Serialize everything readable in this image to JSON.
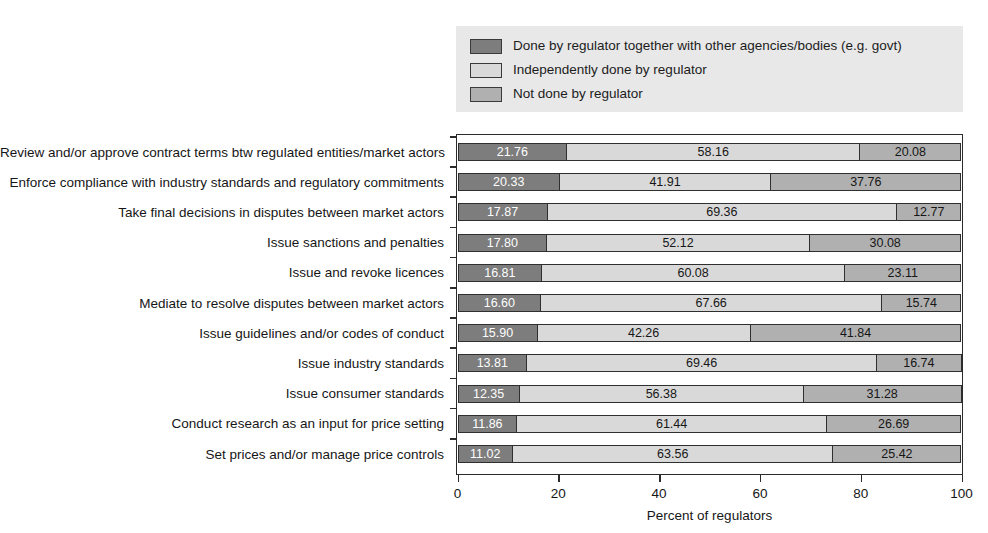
{
  "chart_data": {
    "type": "bar",
    "orientation": "horizontal",
    "stacked": true,
    "title": "",
    "xlabel": "Percent of regulators",
    "ylabel": "",
    "xlim": [
      0,
      100
    ],
    "xticks": [
      0,
      20,
      40,
      60,
      80,
      100
    ],
    "xticklabels": [
      "0",
      "20",
      "40",
      "60",
      "80",
      "100"
    ],
    "grid": false,
    "legend_position": "top",
    "categories": [
      "Review and/or approve contract terms btw regulated entities/market actors",
      "Enforce compliance with industry standards and regulatory commitments",
      "Take final decisions in disputes between market actors",
      "Issue sanctions and penalties",
      "Issue and revoke licences",
      "Mediate to resolve disputes between market actors",
      "Issue guidelines and/or codes of conduct",
      "Issue industry standards",
      "Issue consumer standards",
      "Conduct research as an input for price setting",
      "Set prices and/or manage price controls"
    ],
    "series": [
      {
        "name": "Done by regulator together with other agencies/bodies (e.g. govt)",
        "color": "#7d7d7d",
        "values": [
          21.76,
          20.33,
          17.87,
          17.8,
          16.81,
          16.6,
          15.9,
          13.81,
          12.35,
          11.86,
          11.02
        ],
        "labels": [
          "21.76",
          "20.33",
          "17.87",
          "17.80",
          "16.81",
          "16.60",
          "15.90",
          "13.81",
          "12.35",
          "11.86",
          "11.02"
        ]
      },
      {
        "name": "Independently done by regulator",
        "color": "#d9d9d9",
        "values": [
          58.16,
          41.91,
          69.36,
          52.12,
          60.08,
          67.66,
          42.26,
          69.46,
          56.38,
          61.44,
          63.56
        ],
        "labels": [
          "58.16",
          "41.91",
          "69.36",
          "52.12",
          "60.08",
          "67.66",
          "42.26",
          "69.46",
          "56.38",
          "61.44",
          "63.56"
        ]
      },
      {
        "name": "Not done by regulator",
        "color": "#b0b0b0",
        "values": [
          20.08,
          37.76,
          12.77,
          30.08,
          23.11,
          15.74,
          41.84,
          16.74,
          31.28,
          26.69,
          25.42
        ],
        "labels": [
          "20.08",
          "37.76",
          "12.77",
          "30.08",
          "23.11",
          "15.74",
          "41.84",
          "16.74",
          "31.28",
          "26.69",
          "25.42"
        ]
      }
    ]
  },
  "legend": {
    "items": [
      {
        "label": "Done by regulator together with other agencies/bodies (e.g. govt)",
        "color": "#7d7d7d"
      },
      {
        "label": "Independently done by regulator",
        "color": "#d9d9d9"
      },
      {
        "label": "Not done by regulator",
        "color": "#b0b0b0"
      }
    ]
  },
  "axis": {
    "x_title": "Percent of regulators",
    "x_ticklabels": [
      "0",
      "20",
      "40",
      "60",
      "80",
      "100"
    ]
  }
}
